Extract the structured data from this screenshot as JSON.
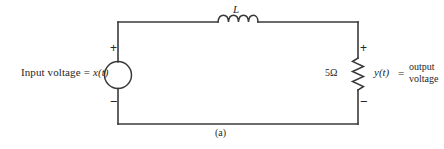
{
  "figure": {
    "caption": "(a)",
    "type": "series RL circuit schematic"
  },
  "source": {
    "label_text": "Input voltage",
    "equals": "=",
    "signal": "x(t)",
    "plus_sign": "+",
    "minus_sign": "−",
    "element": "voltage-source-circle"
  },
  "inductor": {
    "label": "L",
    "element": "inductor-coil",
    "turns": 4
  },
  "resistor": {
    "value": "5Ω",
    "element": "resistor-zigzag",
    "plus_sign": "+",
    "minus_sign": "−"
  },
  "output": {
    "signal": "y(t)",
    "equals": "=",
    "line1": "output",
    "line2": "voltage"
  },
  "colors": {
    "wire": "#3a3a3a",
    "text": "#262626",
    "background": "#ffffff"
  }
}
